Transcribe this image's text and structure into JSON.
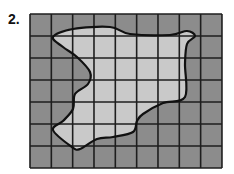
{
  "problem": {
    "number_label": "2."
  },
  "grid": {
    "columns": 9,
    "rows": 7,
    "left": 30,
    "top": 14,
    "cell_width": 21.33,
    "cell_height": 22,
    "outside_color": "#8c8c8c",
    "inside_color": "#c9c9c9",
    "line_color": "#1e1e1e"
  },
  "shape": {
    "description": "irregular closed region drawn over a 9x7 square grid for area estimation",
    "outline_color": "#111111",
    "points": [
      [
        23,
        23
      ],
      [
        43,
        15
      ],
      [
        80,
        13
      ],
      [
        100,
        20
      ],
      [
        140,
        21
      ],
      [
        157,
        17
      ],
      [
        165,
        22
      ],
      [
        157,
        30
      ],
      [
        155,
        50
      ],
      [
        155,
        83
      ],
      [
        133,
        89
      ],
      [
        113,
        100
      ],
      [
        107,
        107
      ],
      [
        103,
        118
      ],
      [
        83,
        123
      ],
      [
        67,
        125
      ],
      [
        50,
        135
      ],
      [
        42,
        133
      ],
      [
        23,
        116
      ],
      [
        33,
        107
      ],
      [
        43,
        95
      ],
      [
        45,
        80
      ],
      [
        58,
        70
      ],
      [
        60,
        58
      ],
      [
        47,
        43
      ],
      [
        33,
        33
      ]
    ]
  }
}
